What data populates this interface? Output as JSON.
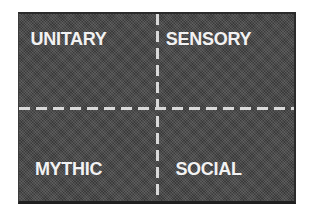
{
  "diagram": {
    "type": "quadrant-grid",
    "colors": {
      "background": "#4a4a4a",
      "divider": "#d9d9d9",
      "text": "#f2f2f2"
    },
    "quadrants": [
      {
        "position": "top-left",
        "label": "UNITARY"
      },
      {
        "position": "top-right",
        "label": "SENSORY"
      },
      {
        "position": "bottom-left",
        "label": "MYTHIC"
      },
      {
        "position": "bottom-right",
        "label": "SOCIAL"
      }
    ]
  }
}
